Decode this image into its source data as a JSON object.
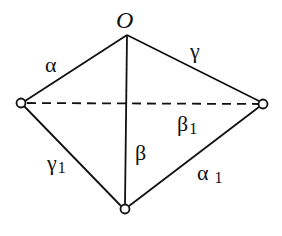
{
  "diagram": {
    "apex_label": "O",
    "edges": {
      "O_left": {
        "label": "α",
        "sub": ""
      },
      "O_right": {
        "label": "γ",
        "sub": ""
      },
      "O_bottom": {
        "label": "β",
        "sub": ""
      },
      "left_right_dashed": {
        "label": "β",
        "sub": "1"
      },
      "left_bottom": {
        "label": "γ",
        "sub": "1"
      },
      "right_bottom": {
        "label": "α",
        "sub": "1"
      }
    },
    "colors": {
      "stroke": "#111111",
      "background": "#ffffff"
    }
  }
}
